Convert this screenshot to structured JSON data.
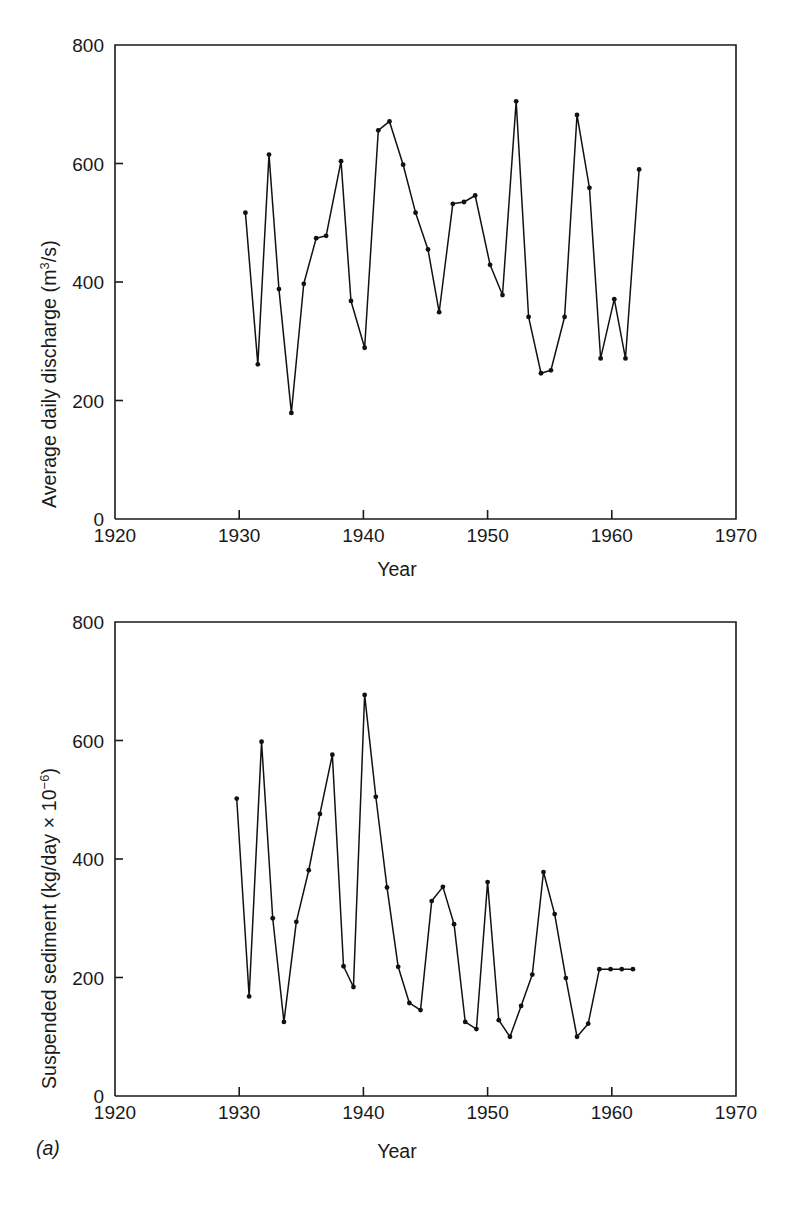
{
  "figure": {
    "panel_letter": "(a)"
  },
  "chart_data": [
    {
      "type": "line",
      "id": "average-daily-discharge",
      "title": "",
      "xlabel": "Year",
      "ylabel": "Average daily discharge (m3/s)",
      "ylabel_parts": {
        "text": "Average daily discharge (m",
        "sup": "3",
        "tail": "/s)"
      },
      "xlim": [
        1920,
        1970
      ],
      "ylim": [
        0,
        800
      ],
      "xticks": [
        1920,
        1930,
        1940,
        1950,
        1960,
        1970
      ],
      "xtick_labels": [
        "1920",
        "1930",
        "1940",
        "1950",
        "1960",
        "1970"
      ],
      "yticks": [
        0,
        200,
        400,
        600,
        800
      ],
      "ytick_labels": [
        "0",
        "200",
        "400",
        "600",
        "800"
      ],
      "grid": false,
      "legend": "none",
      "marker": "filled-circle",
      "x": [
        1930.5,
        1931.5,
        1932.4,
        1933.2,
        1934.2,
        1935.2,
        1936.2,
        1937.0,
        1938.2,
        1939.0,
        1940.1,
        1941.2,
        1942.1,
        1943.2,
        1944.2,
        1945.2,
        1946.1,
        1947.2,
        1948.1,
        1949.0,
        1950.2,
        1951.2,
        1952.3,
        1953.3,
        1954.3,
        1955.1,
        1956.2,
        1957.2,
        1958.2,
        1959.1,
        1960.2,
        1961.1,
        1962.2
      ],
      "y": [
        517,
        261,
        615,
        388,
        179,
        397,
        474,
        478,
        604,
        368,
        289,
        656,
        671,
        598,
        517,
        455,
        349,
        532,
        535,
        546,
        429,
        378,
        705,
        341,
        246,
        251,
        341,
        682,
        559,
        271,
        371,
        271,
        590
      ]
    },
    {
      "type": "line",
      "id": "suspended-sediment",
      "title": "",
      "xlabel": "Year",
      "ylabel": "Suspended sediment (kg/day x 10-6)",
      "ylabel_parts": {
        "text": "Suspended sediment (kg/day × 10",
        "sup": "−6",
        "tail": ")"
      },
      "xlim": [
        1920,
        1970
      ],
      "ylim": [
        0,
        800
      ],
      "xticks": [
        1920,
        1930,
        1940,
        1950,
        1960,
        1970
      ],
      "xtick_labels": [
        "1920",
        "1930",
        "1940",
        "1950",
        "1960",
        "1970"
      ],
      "yticks": [
        0,
        200,
        400,
        600,
        800
      ],
      "ytick_labels": [
        "0",
        "200",
        "400",
        "600",
        "800"
      ],
      "grid": false,
      "legend": "none",
      "marker": "filled-circle",
      "x": [
        1929.8,
        1930.8,
        1931.8,
        1932.7,
        1933.6,
        1934.6,
        1935.6,
        1936.5,
        1937.5,
        1938.4,
        1939.2,
        1940.1,
        1941.0,
        1941.9,
        1942.8,
        1943.7,
        1944.6,
        1945.5,
        1946.4,
        1947.3,
        1948.2,
        1949.1,
        1950.0,
        1950.9,
        1951.8,
        1952.7,
        1953.6,
        1954.5,
        1955.4,
        1956.3,
        1957.2,
        1958.1,
        1959.0,
        1959.9,
        1960.8,
        1961.7
      ],
      "y": [
        502,
        168,
        598,
        300,
        125,
        294,
        381,
        476,
        576,
        219,
        184,
        677,
        505,
        352,
        218,
        157,
        145,
        329,
        353,
        290,
        125,
        113,
        361,
        128,
        100,
        152,
        205,
        378,
        307,
        199,
        100,
        122,
        214,
        214,
        214,
        214
      ]
    }
  ]
}
